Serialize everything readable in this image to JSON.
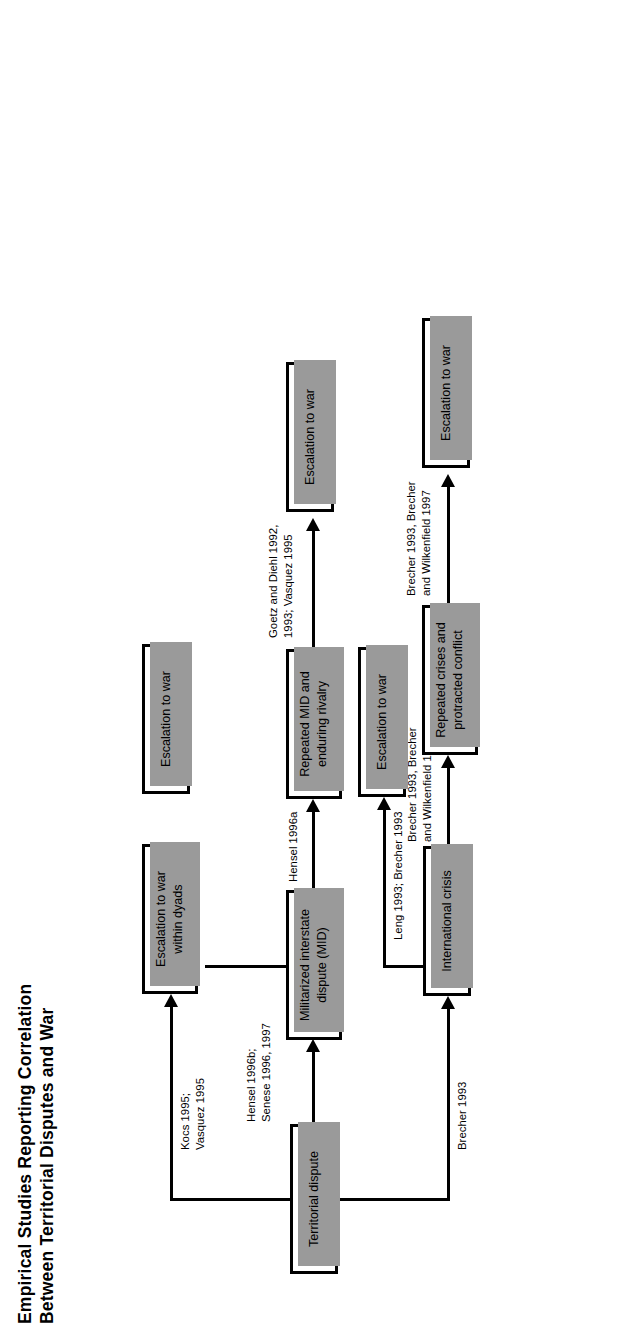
{
  "figure": {
    "title": {
      "line1": "Empirical Studies Reporting Correlation",
      "line2": "Between Territorial Disputes and War"
    },
    "nodes": {
      "territorial_dispute": "Territorial dispute",
      "escalation_within_dyads_l1": "Escalation to war",
      "escalation_within_dyads_l2": "within dyads",
      "mid_l1": "Militarized interstate",
      "mid_l2": "dispute (MID)",
      "international_crisis": "International crisis",
      "escalation_war_top": "Escalation to war",
      "repeated_mid_l1": "Repeated MID and",
      "repeated_mid_l2": "enduring rivalry",
      "escalation_war_mid": "Escalation to war",
      "escalation_war_from_mid": "Escalation to war",
      "repeated_crises_l1": "Repeated crises and",
      "repeated_crises_l2": "protracted conflict",
      "escalation_war_bottom": "Escalation to war"
    },
    "edges": {
      "kocs_vasquez_l1": "Kocs 1995;",
      "kocs_vasquez_l2": "Vasquez 1995",
      "hensel_senese_l1": "Hensel 1996b;",
      "hensel_senese_l2": "Senese 1996, 1997",
      "brecher_1993": "Brecher 1993",
      "hensel_1996a": "Hensel 1996a",
      "leng_brecher": "Leng 1993; Brecher 1993",
      "goetz_diehl_l1": "Goetz and Diehl 1992,",
      "goetz_diehl_l2": "1993; Vasquez 1995",
      "brecher_wilkenfeld_a_l1": "Brecher 1993, Brecher",
      "brecher_wilkenfeld_a_l2": "and Wilkenfield 1997",
      "brecher_wilkenfeld_b_l1": "Brecher 1993, Brecher",
      "brecher_wilkenfeld_b_l2": "and Wilkenfield 1997"
    },
    "colors": {
      "stroke": "#000000",
      "shadow": "#9a9a9a",
      "background": "#ffffff"
    }
  }
}
